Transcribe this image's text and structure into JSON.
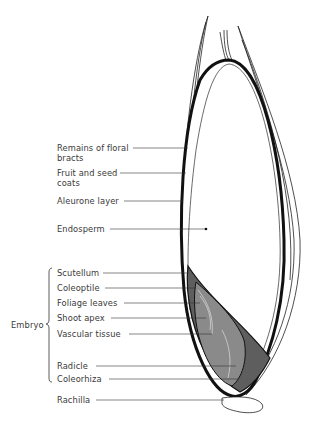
{
  "figure": {
    "labels": [
      {
        "id": "remains_floral_bracts",
        "text": "Remains of floral",
        "text2": "bracts"
      },
      {
        "id": "fruit_seed_coats",
        "text": "Fruit and seed",
        "text2": "coats"
      },
      {
        "id": "aleurone_layer",
        "text": "Aleurone layer"
      },
      {
        "id": "endosperm",
        "text": "Endosperm"
      },
      {
        "id": "scutellum",
        "text": "Scutellum"
      },
      {
        "id": "coleoptile",
        "text": "Coleoptile"
      },
      {
        "id": "foliage_leaves",
        "text": "Foliage leaves"
      },
      {
        "id": "shoot_apex",
        "text": "Shoot apex"
      },
      {
        "id": "vascular_tissue",
        "text": "Vascular tissue"
      },
      {
        "id": "radicle",
        "text": "Radicle"
      },
      {
        "id": "coleorhiza",
        "text": "Coleorhiza"
      },
      {
        "id": "rachilla",
        "text": "Rachilla"
      }
    ],
    "group_label": "Embryo",
    "colors": {
      "outline": "#111111",
      "embryo_fill": "#7a7a7a",
      "scutellum_fill": "#5e5e5e",
      "text": "#3a3a3a"
    }
  }
}
